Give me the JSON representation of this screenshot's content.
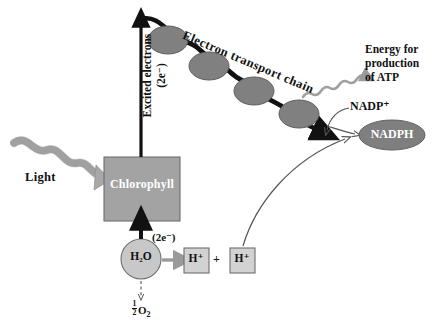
{
  "diagram": {
    "background": "#ffffff",
    "colors": {
      "carrier_oval": "#808080",
      "chlorophyll_box": "#a3a3a3",
      "h2o_circle": "#c8c8c8",
      "hplus_box": "#d2d2d2",
      "nadph_oval": "#7f7f7f",
      "light_arrow": "#a8a8a8",
      "energy_arrow": "#a0a0a0",
      "thick_arrow": "#111111",
      "thin_arrow": "#555555",
      "text_dark": "#111111",
      "text_light": "#ffffff"
    }
  },
  "labels": {
    "light": "Light",
    "chlorophyll": "Chlorophyll",
    "excited_electrons_line1": "Excited electrons",
    "excited_electrons_line2": "(2e⁻)",
    "electron_transport_chain": "Electron transport chain",
    "water": "H₂O",
    "oxygen": "½O₂",
    "oxygen_numerator": "1",
    "oxygen_denominator": "2",
    "oxygen_symbol": "O",
    "oxygen_subscript": "2",
    "proton_1": "H⁺",
    "proton_2": "H⁺",
    "plus": "+",
    "electrons_from_water": "(2e⁻)",
    "nadp_plus": "NADP⁺",
    "nadph": "NADPH",
    "energy_line1": "Energy for",
    "energy_line2": "production",
    "energy_line3": "of ATP"
  },
  "elements": {
    "carriers": [
      {
        "name": "carrier-1",
        "cx": 168,
        "cy": 40,
        "rx": 20,
        "ry": 14
      },
      {
        "name": "carrier-2",
        "cx": 209,
        "cy": 66,
        "rx": 20,
        "ry": 14
      },
      {
        "name": "carrier-3",
        "cx": 254,
        "cy": 91,
        "rx": 20,
        "ry": 14
      },
      {
        "name": "carrier-4",
        "cx": 299,
        "cy": 114,
        "rx": 20,
        "ry": 14
      }
    ],
    "chlorophyll_box": {
      "x": 104,
      "y": 157,
      "w": 76,
      "h": 64
    },
    "water_circle": {
      "cx": 141,
      "cy": 259,
      "r": 20
    },
    "proton_boxes": [
      {
        "x": 184,
        "y": 248,
        "w": 25,
        "h": 25
      },
      {
        "x": 230,
        "y": 248,
        "w": 25,
        "h": 25
      }
    ],
    "nadph_oval": {
      "cx": 392,
      "cy": 135,
      "rx": 33,
      "ry": 15
    }
  }
}
